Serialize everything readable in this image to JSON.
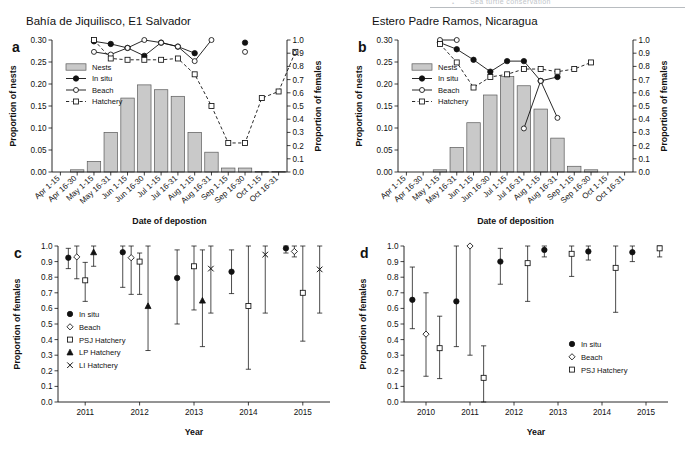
{
  "running_head": {
    "text": "Sea turtle conservation",
    "bullet": "•"
  },
  "panels": {
    "a": {
      "letter": "a",
      "title": "Bahía de Jiquilisco, E1 Salvador",
      "xlabel": "Date of depostion",
      "ylabel_left": "Proportion of nests",
      "ylabel_right": "Proportion of females",
      "legend": [
        "Nests",
        "In situ",
        "Beach",
        "Hatchery"
      ]
    },
    "b": {
      "letter": "b",
      "title": "Estero Padre Ramos, Nicaragua",
      "xlabel": "Date of deposition",
      "ylabel_left": "Proportion of nests",
      "ylabel_right": "Proportion of females",
      "legend": [
        "Nests",
        "In situ",
        "Beach",
        "Hatchery"
      ]
    },
    "c": {
      "letter": "c",
      "xlabel": "Year",
      "ylabel": "Proportion of females",
      "legend": [
        "In situ",
        "Beach",
        "PSJ Hatchery",
        "LP Hatchery",
        "LI Hatchery"
      ]
    },
    "d": {
      "letter": "d",
      "xlabel": "Year",
      "ylabel": "Proportion of females",
      "legend": [
        "In situ",
        "Beach",
        "PSJ Hatchery"
      ]
    }
  },
  "chart_data": [
    {
      "id": "a",
      "type": "bar",
      "title": "Bahía de Jiquilisco, E1 Salvador",
      "xlabel": "Date of depostion",
      "ylabel": "Proportion of nests",
      "ylabel2": "Proportion of females",
      "categories": [
        "Apr 1-15",
        "Apr 16-30",
        "May 1-15",
        "May 16-31",
        "Jun 1-15",
        "Jun 16-30",
        "Jul 1-15",
        "Jul 16-31",
        "Aug 1-15",
        "Aug 16-31",
        "Sep 1-15",
        "Sep 16-30",
        "Oct 1-15",
        "Oct 16-31"
      ],
      "ylim": [
        0.0,
        0.3
      ],
      "yticks": [
        "0.00",
        "0.05",
        "0.10",
        "0.15",
        "0.20",
        "0.25",
        "0.30"
      ],
      "ylim2": [
        0.0,
        1.0
      ],
      "yticks2": [
        "0.0",
        "0.1",
        "0.2",
        "0.3",
        "0.4",
        "0.5",
        "0.6",
        "0.7",
        "0.8",
        "0.9",
        "1.0"
      ],
      "grid": false,
      "legend_position": "upper-left",
      "series": [
        {
          "name": "Nests",
          "axis": "left",
          "marker": "bar",
          "values": [
            0.0,
            0.005,
            0.024,
            0.09,
            0.168,
            0.198,
            0.187,
            0.172,
            0.09,
            0.045,
            0.009,
            0.009,
            0.001,
            0.001
          ]
        },
        {
          "name": "In situ",
          "axis": "right",
          "marker": "filled-circle",
          "line": "solid",
          "values": [
            null,
            null,
            0.99,
            0.97,
            0.94,
            0.88,
            0.98,
            0.95,
            0.9,
            null,
            null,
            0.98,
            null,
            null
          ]
        },
        {
          "name": "Beach",
          "axis": "right",
          "marker": "open-circle",
          "line": "solid",
          "values": [
            null,
            null,
            0.91,
            0.89,
            0.94,
            1.0,
            0.98,
            0.95,
            0.84,
            1.0,
            null,
            0.91,
            null,
            null
          ]
        },
        {
          "name": "Hatchery",
          "axis": "right",
          "marker": "open-square",
          "line": "dashed",
          "values": [
            null,
            null,
            1.0,
            0.86,
            0.85,
            0.85,
            0.85,
            0.86,
            0.74,
            0.5,
            0.22,
            0.22,
            0.56,
            0.61,
            0.91
          ]
        }
      ]
    },
    {
      "id": "b",
      "type": "bar",
      "title": "Estero Padre Ramos, Nicaragua",
      "xlabel": "Date of deposition",
      "ylabel": "Proportion of nests",
      "ylabel2": "Proportion of females",
      "categories": [
        "Apr 1-15",
        "Apr 16-30",
        "May 1-15",
        "May 16-31",
        "Jun 1-15",
        "Jun 16-30",
        "Jul 1-15",
        "Jul 16-31",
        "Aug 1-15",
        "Aug 16-31",
        "Sep 1-15",
        "Sep 16-30",
        "Oct 1-15",
        "Oct 16-31"
      ],
      "ylim": [
        0.0,
        0.3
      ],
      "yticks": [
        "0.00",
        "0.05",
        "0.10",
        "0.15",
        "0.20",
        "0.25",
        "0.30"
      ],
      "ylim2": [
        0.0,
        1.0
      ],
      "yticks2": [
        "0.0",
        "0.1",
        "0.2",
        "0.3",
        "0.4",
        "0.5",
        "0.6",
        "0.7",
        "0.8",
        "0.9",
        "1.0"
      ],
      "grid": false,
      "legend_position": "upper-left",
      "series": [
        {
          "name": "Nests",
          "axis": "left",
          "marker": "bar",
          "values": [
            0.0,
            0.0,
            0.005,
            0.056,
            0.112,
            0.175,
            0.217,
            0.196,
            0.143,
            0.077,
            0.013,
            0.005,
            0.0,
            0.0
          ]
        },
        {
          "name": "In situ",
          "axis": "right",
          "marker": "filled-circle",
          "line": "solid",
          "values": [
            null,
            null,
            0.98,
            0.93,
            0.85,
            0.76,
            0.84,
            0.84,
            0.69,
            0.72,
            null,
            null,
            null,
            null
          ]
        },
        {
          "name": "Beach",
          "axis": "right",
          "marker": "open-circle",
          "line": "solid",
          "values": [
            null,
            null,
            1.0,
            1.0,
            null,
            null,
            null,
            0.33,
            0.69,
            0.41,
            null,
            null,
            null,
            null
          ]
        },
        {
          "name": "Hatchery",
          "axis": "right",
          "marker": "open-square",
          "line": "dashed",
          "values": [
            null,
            null,
            0.97,
            0.83,
            0.64,
            0.72,
            0.74,
            0.78,
            0.78,
            0.76,
            0.78,
            0.83,
            null,
            null
          ]
        }
      ]
    },
    {
      "id": "c",
      "type": "scatter",
      "xlabel": "Year",
      "ylabel": "Proportion of females",
      "categories": [
        "2011",
        "2012",
        "2013",
        "2014",
        "2015"
      ],
      "ylim": [
        0.0,
        1.0
      ],
      "yticks": [
        "0.0",
        "0.1",
        "0.2",
        "0.3",
        "0.4",
        "0.5",
        "0.6",
        "0.7",
        "0.8",
        "0.9",
        "1.0"
      ],
      "grid": false,
      "legend_position": "lower-left",
      "series": [
        {
          "name": "In situ",
          "marker": "filled-circle",
          "points": [
            {
              "x": "2011",
              "y": 0.925,
              "lo": 0.855,
              "hi": 0.985
            },
            {
              "x": "2012",
              "y": 0.96,
              "lo": 0.735,
              "hi": 1.0
            },
            {
              "x": "2013",
              "y": 0.795,
              "lo": 0.5,
              "hi": 0.975
            },
            {
              "x": "2014",
              "y": 0.835,
              "lo": 0.695,
              "hi": 0.975
            },
            {
              "x": "2015",
              "y": 0.985,
              "lo": 0.955,
              "hi": 1.0
            }
          ]
        },
        {
          "name": "Beach",
          "marker": "open-diamond",
          "points": [
            {
              "x": "2011",
              "y": 0.93,
              "lo": 0.79,
              "hi": 1.0
            },
            {
              "x": "2012",
              "y": 0.925,
              "lo": 0.69,
              "hi": 1.0
            },
            {
              "x": "2015",
              "y": 0.965,
              "lo": 0.93,
              "hi": 1.0
            }
          ]
        },
        {
          "name": "PSJ Hatchery",
          "marker": "open-square",
          "points": [
            {
              "x": "2011",
              "y": 0.78,
              "lo": 0.645,
              "hi": 0.895
            },
            {
              "x": "2012",
              "y": 0.9,
              "lo": 0.69,
              "hi": 0.955
            },
            {
              "x": "2013",
              "y": 0.87,
              "lo": 0.59,
              "hi": 1.0
            },
            {
              "x": "2014",
              "y": 0.615,
              "lo": 0.21,
              "hi": 1.0
            },
            {
              "x": "2015",
              "y": 0.7,
              "lo": 0.39,
              "hi": 1.0
            }
          ]
        },
        {
          "name": "LP Hatchery",
          "marker": "filled-triangle",
          "points": [
            {
              "x": "2011",
              "y": 0.96,
              "lo": 0.87,
              "hi": 1.0
            },
            {
              "x": "2012",
              "y": 0.615,
              "lo": 0.33,
              "hi": 1.0
            },
            {
              "x": "2013",
              "y": 0.65,
              "lo": 0.355,
              "hi": 0.975
            }
          ]
        },
        {
          "name": "LI Hatchery",
          "marker": "cross",
          "points": [
            {
              "x": "2013",
              "y": 0.855,
              "lo": 0.57,
              "hi": 1.0
            },
            {
              "x": "2014",
              "y": 0.945,
              "lo": 0.57,
              "hi": 1.0
            },
            {
              "x": "2015",
              "y": 0.85,
              "lo": 0.57,
              "hi": 1.0
            }
          ]
        }
      ]
    },
    {
      "id": "d",
      "type": "scatter",
      "xlabel": "Year",
      "ylabel": "Proportion of females",
      "categories": [
        "2010",
        "2011",
        "2012",
        "2013",
        "2014",
        "2015"
      ],
      "ylim": [
        0.0,
        1.0
      ],
      "yticks": [
        "0.0",
        "0.1",
        "0.2",
        "0.3",
        "0.4",
        "0.5",
        "0.6",
        "0.7",
        "0.8",
        "0.9",
        "1.0"
      ],
      "grid": false,
      "legend_position": "lower-right",
      "series": [
        {
          "name": "In situ",
          "marker": "filled-circle",
          "points": [
            {
              "x": "2010",
              "y": 0.655,
              "lo": 0.47,
              "hi": 0.865
            },
            {
              "x": "2011",
              "y": 0.645,
              "lo": 0.355,
              "hi": 1.0
            },
            {
              "x": "2012",
              "y": 0.9,
              "lo": 0.755,
              "hi": 0.985
            },
            {
              "x": "2013",
              "y": 0.975,
              "lo": 0.93,
              "hi": 1.0
            },
            {
              "x": "2014",
              "y": 0.965,
              "lo": 0.91,
              "hi": 1.0
            },
            {
              "x": "2015",
              "y": 0.96,
              "lo": 0.9,
              "hi": 1.0
            }
          ]
        },
        {
          "name": "Beach",
          "marker": "open-diamond",
          "points": [
            {
              "x": "2010",
              "y": 0.435,
              "lo": 0.165,
              "hi": 0.7
            },
            {
              "x": "2011",
              "y": 1.0,
              "lo": 0.3,
              "hi": 1.0
            }
          ]
        },
        {
          "name": "PSJ Hatchery",
          "marker": "open-square",
          "points": [
            {
              "x": "2010",
              "y": 0.345,
              "lo": 0.15,
              "hi": 0.55
            },
            {
              "x": "2011",
              "y": 0.155,
              "lo": 0.0,
              "hi": 0.36
            },
            {
              "x": "2012",
              "y": 0.89,
              "lo": 0.645,
              "hi": 1.0
            },
            {
              "x": "2013",
              "y": 0.95,
              "lo": 0.805,
              "hi": 1.0
            },
            {
              "x": "2014",
              "y": 0.86,
              "lo": 0.575,
              "hi": 1.0
            },
            {
              "x": "2015",
              "y": 0.985,
              "lo": 0.93,
              "hi": 1.0
            }
          ]
        }
      ]
    }
  ]
}
